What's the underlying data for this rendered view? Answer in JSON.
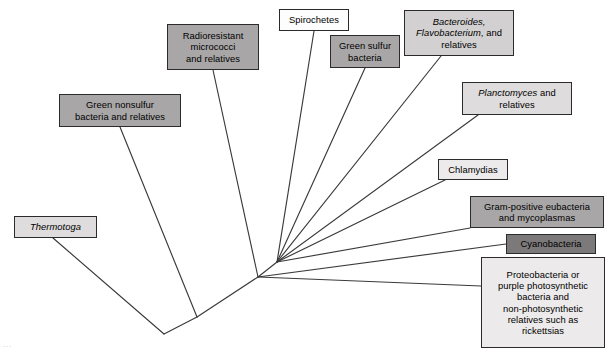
{
  "figure": {
    "type": "phylogenetic-tree",
    "title": "",
    "background_color": "#ffffff",
    "line_color": "#3a3a3a",
    "corner_artifact": "..."
  },
  "shades": {
    "white": "#fdfdfd",
    "very_light": "#eceaea",
    "light": "#dedcdc",
    "medium_light": "#d2d0d0",
    "medium": "#a8a6a6",
    "dark": "#8e8c8c",
    "darkest": "#7b7979"
  },
  "taxa": [
    {
      "id": "thermotoga",
      "label": "Thermotoga",
      "lines": [
        {
          "text": "Thermotoga",
          "italic": true
        }
      ],
      "shade": "light",
      "x": 14,
      "y": 216,
      "w": 83,
      "h": 22,
      "tip_x": 53,
      "tip_y": 238
    },
    {
      "id": "green-nonsulfur",
      "label": "Green nonsulfur bacteria and relatives",
      "lines": [
        {
          "text": "Green nonsulfur",
          "italic": false
        },
        {
          "text": "bacteria and relatives",
          "italic": false
        }
      ],
      "shade": "medium",
      "x": 59,
      "y": 94,
      "w": 122,
      "h": 33,
      "tip_x": 120,
      "tip_y": 127
    },
    {
      "id": "radioresistant",
      "label": "Radioresistant micrococci and relatives",
      "lines": [
        {
          "text": "Radioresistant",
          "italic": false
        },
        {
          "text": "micrococci",
          "italic": false
        },
        {
          "text": "and relatives",
          "italic": false
        }
      ],
      "shade": "medium",
      "x": 167,
      "y": 24,
      "w": 92,
      "h": 46,
      "tip_x": 213,
      "tip_y": 70
    },
    {
      "id": "spirochetes",
      "label": "Spirochetes",
      "lines": [
        {
          "text": "Spirochetes",
          "italic": false
        }
      ],
      "shade": "white",
      "x": 279,
      "y": 9,
      "w": 70,
      "h": 22,
      "tip_x": 314,
      "tip_y": 31
    },
    {
      "id": "green-sulfur",
      "label": "Green sulfur bacteria",
      "lines": [
        {
          "text": "Green sulfur",
          "italic": false
        },
        {
          "text": "bacteria",
          "italic": false
        }
      ],
      "shade": "medium",
      "x": 330,
      "y": 35,
      "w": 70,
      "h": 33,
      "tip_x": 365,
      "tip_y": 68
    },
    {
      "id": "bacteroides",
      "label": "Bacteroides, Flavobacterium, and relatives",
      "lines": [
        {
          "text": "Bacteroides,",
          "italic": true
        },
        {
          "text": "Flavobacterium|, and",
          "italic": false
        },
        {
          "text": "relatives",
          "italic": false
        }
      ],
      "shade": "medium_light",
      "x": 404,
      "y": 10,
      "w": 110,
      "h": 46,
      "tip_x": 441,
      "tip_y": 56
    },
    {
      "id": "planctomyces",
      "label": "Planctomyces and relatives",
      "lines": [
        {
          "text": "Planctomyces| and",
          "italic": false
        },
        {
          "text": "relatives",
          "italic": false
        }
      ],
      "shade": "light",
      "x": 462,
      "y": 82,
      "w": 110,
      "h": 33,
      "tip_x": 478,
      "tip_y": 115
    },
    {
      "id": "chlamydias",
      "label": "Chlamydias",
      "lines": [
        {
          "text": "Chlamydias",
          "italic": false
        }
      ],
      "shade": "very_light",
      "x": 438,
      "y": 159,
      "w": 70,
      "h": 21,
      "tip_x": 445,
      "tip_y": 180
    },
    {
      "id": "gram-positive",
      "label": "Gram-positive eubacteria and mycoplasmas",
      "lines": [
        {
          "text": "Gram-positive eubacteria",
          "italic": false
        },
        {
          "text": "and mycoplasmas",
          "italic": false
        }
      ],
      "shade": "medium",
      "x": 470,
      "y": 196,
      "w": 134,
      "h": 32,
      "tip_x": 470,
      "tip_y": 228
    },
    {
      "id": "cyanobacteria",
      "label": "Cyanobacteria",
      "lines": [
        {
          "text": "Cyanobacteria",
          "italic": false
        }
      ],
      "shade": "darkest",
      "x": 506,
      "y": 234,
      "w": 90,
      "h": 20,
      "tip_x": 506,
      "tip_y": 244
    },
    {
      "id": "proteobacteria",
      "label": "Proteobacteria or purple photosynthetic bacteria and non-photosynthetic relatives such as rickettsias",
      "lines": [
        {
          "text": "Proteobacteria or",
          "italic": false
        },
        {
          "text": "purple photosynthetic",
          "italic": false
        },
        {
          "text": "bacteria and",
          "italic": false
        },
        {
          "text": "non-photosynthetic",
          "italic": false
        },
        {
          "text": "relatives such as",
          "italic": false
        },
        {
          "text": "rickettsias",
          "italic": false
        }
      ],
      "shade": "very_light",
      "x": 481,
      "y": 257,
      "w": 124,
      "h": 91,
      "tip_x": 481,
      "tip_y": 286
    }
  ],
  "nodes": {
    "root": {
      "x": 164,
      "y": 334
    },
    "mid": {
      "x": 197,
      "y": 317
    },
    "lower_fan": {
      "x": 258,
      "y": 277
    },
    "upper_fan": {
      "x": 277,
      "y": 262
    }
  },
  "branches": [
    {
      "from": "tip:thermotoga",
      "to": "root"
    },
    {
      "from": "root",
      "to": "mid"
    },
    {
      "from": "mid",
      "to": "tip:green-nonsulfur"
    },
    {
      "from": "mid",
      "to": "lower_fan"
    },
    {
      "from": "lower_fan",
      "to": "tip:radioresistant"
    },
    {
      "from": "lower_fan",
      "to": "upper_fan"
    },
    {
      "from": "upper_fan",
      "to": "tip:spirochetes"
    },
    {
      "from": "upper_fan",
      "to": "tip:green-sulfur"
    },
    {
      "from": "upper_fan",
      "to": "tip:bacteroides"
    },
    {
      "from": "upper_fan",
      "to": "tip:planctomyces"
    },
    {
      "from": "upper_fan",
      "to": "tip:chlamydias"
    },
    {
      "from": "upper_fan",
      "to": "tip:gram-positive"
    },
    {
      "from": "lower_fan",
      "to": "tip:cyanobacteria"
    },
    {
      "from": "lower_fan",
      "to": "tip:proteobacteria"
    }
  ]
}
